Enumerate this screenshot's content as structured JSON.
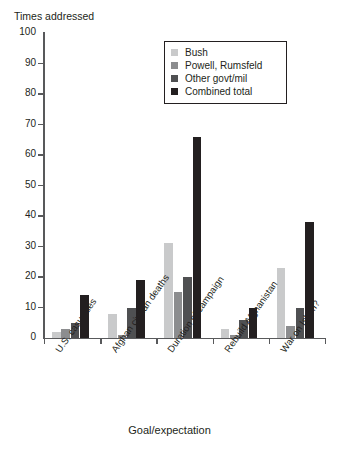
{
  "chart_data": {
    "type": "bar",
    "title": "",
    "subtitle": "",
    "ylabel": "Times addressed",
    "xlabel": "Goal/expectation",
    "ylim": [
      0,
      100
    ],
    "yticks": [
      0,
      10,
      20,
      30,
      40,
      50,
      60,
      70,
      80,
      90,
      100
    ],
    "grid": false,
    "legend_position": "top-right",
    "categories": [
      "U.S. casualties",
      "Afghan civilian deaths",
      "Duration of campaign",
      "Rebuild Afghanistan",
      "War on Islam?"
    ],
    "series": [
      {
        "name": "Bush",
        "color": "#c9cacb",
        "values": [
          2,
          8,
          31,
          3,
          23
        ]
      },
      {
        "name": "Powell, Rumsfeld",
        "color": "#8c8d8f",
        "values": [
          3,
          1,
          15,
          1,
          4
        ]
      },
      {
        "name": "Other govt/mil",
        "color": "#4f5052",
        "values": [
          5,
          10,
          20,
          6,
          10
        ]
      },
      {
        "name": "Combined total",
        "color": "#231f20",
        "values": [
          14,
          19,
          66,
          10,
          38
        ]
      }
    ]
  },
  "axes": {
    "y_title": "Times addressed",
    "x_title": "Goal/expectation"
  }
}
